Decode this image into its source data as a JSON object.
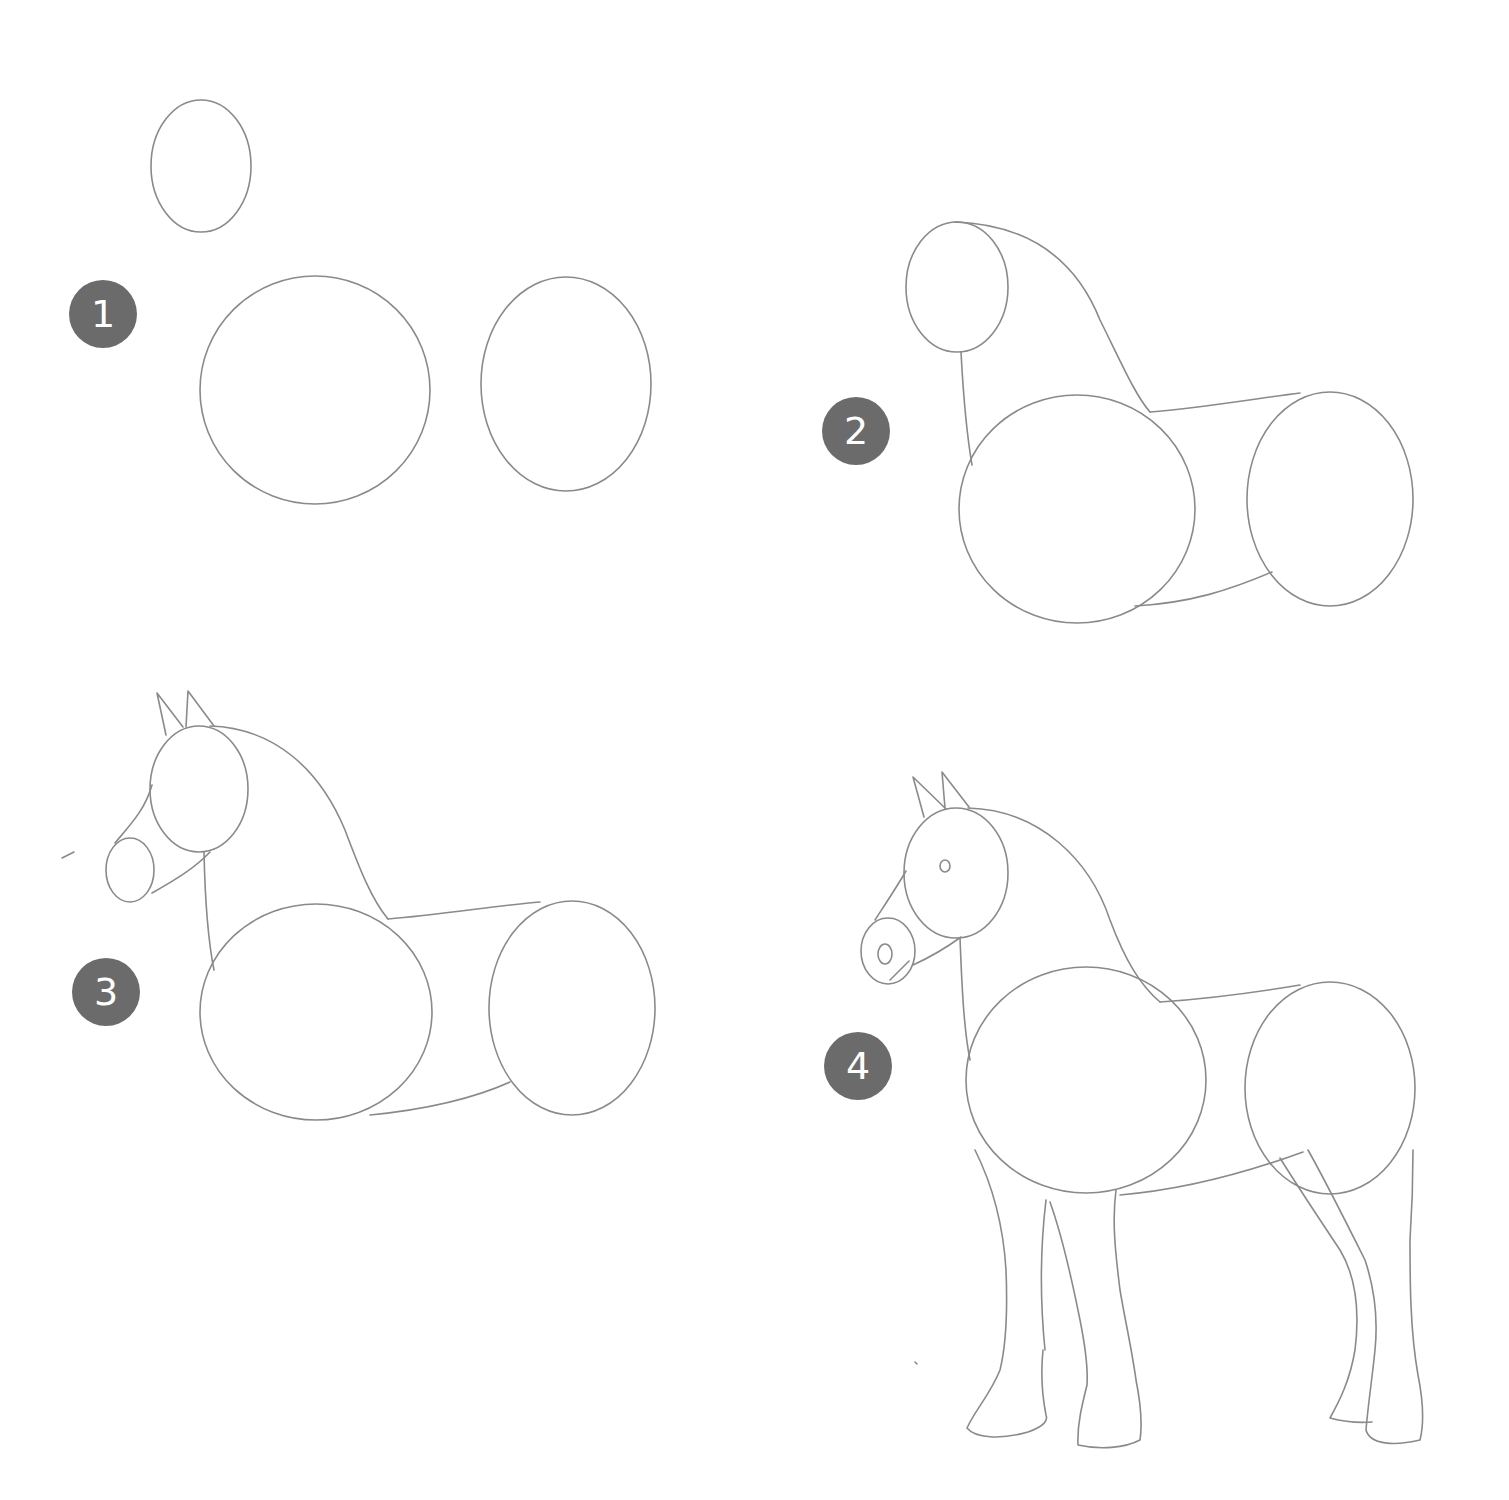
{
  "steps": [
    {
      "number": "1",
      "description": "Three ovals: head, chest, hindquarters"
    },
    {
      "number": "2",
      "description": "Connect head to body with neck and back/belly lines"
    },
    {
      "number": "3",
      "description": "Add ears and muzzle"
    },
    {
      "number": "4",
      "description": "Add eye, nostril and four legs"
    }
  ],
  "colors": {
    "badge": "#6b6b6b",
    "badge_text": "#ffffff",
    "pencil": "#8a8a8a",
    "background": "#ffffff"
  }
}
